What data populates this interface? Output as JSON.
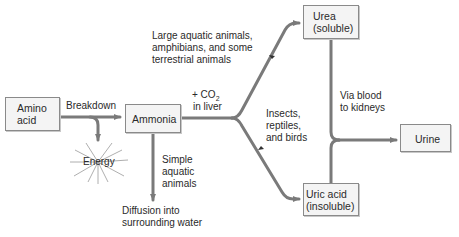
{
  "diagram": {
    "nodes": {
      "amino_acid": {
        "line1": "Amino",
        "line2": "acid"
      },
      "ammonia": {
        "label": "Ammonia"
      },
      "urea": {
        "line1": "Urea",
        "line2": "(soluble)"
      },
      "uric_acid": {
        "line1": "Uric acid",
        "line2": "(insoluble)"
      },
      "urine": {
        "label": "Urine"
      },
      "energy": {
        "label": "Energy"
      },
      "diffusion": {
        "line1": "Diffusion into",
        "line2": "surrounding water"
      }
    },
    "edge_labels": {
      "breakdown": "Breakdown",
      "co2_prefix": "+ CO",
      "co2_sub": "2",
      "in_liver": "in liver",
      "large_aquatic": [
        "Large aquatic animals,",
        "amphibians, and some",
        "terrestrial animals"
      ],
      "insects": [
        "Insects,",
        "reptiles,",
        "and birds"
      ],
      "simple_aquatic": [
        "Simple",
        "aquatic",
        "animals"
      ],
      "via_blood": [
        "Via blood",
        "to kidneys"
      ]
    },
    "colors": {
      "arrow": "#7a7a7a",
      "box_fill": "#f4f4f4",
      "box_border": "#8a8a8a",
      "text": "#2a2a2a"
    }
  }
}
